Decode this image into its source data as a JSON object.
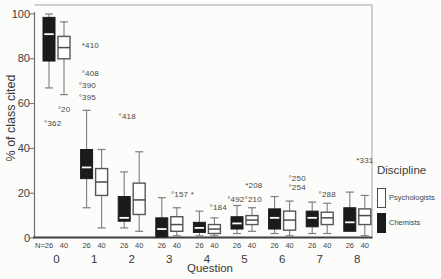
{
  "figure": {
    "background": "#fcfcfa",
    "frame_color": "#a3a3a3",
    "axis_color": "#3d3d3d",
    "whisker_color": "#7e7e7e",
    "text_color": "#3b3b3b"
  },
  "chart_data": {
    "type": "boxplot",
    "title": "",
    "xlabel": "Question",
    "ylabel": "% of class cited",
    "ylim": [
      0,
      100
    ],
    "yticks": [
      0,
      20,
      40,
      60,
      80,
      100
    ],
    "categories": [
      "0",
      "1",
      "2",
      "3",
      "4",
      "5",
      "6",
      "7",
      "8"
    ],
    "n_row_prefix": "N=",
    "grid": false,
    "series": [
      {
        "name": "Chemists",
        "n_label": "26",
        "fill": "#1b1b1b",
        "style": "filled",
        "x_offset": -7.5,
        "boxes": [
          {
            "lo": 67,
            "q1": 79,
            "med": 91,
            "q3": 98.5,
            "hi": 100
          },
          {
            "lo": 13.5,
            "q1": 26.5,
            "med": 31.5,
            "q3": 39.5,
            "hi": 57
          },
          {
            "lo": 4.5,
            "q1": 7.5,
            "med": 9,
            "q3": 18.5,
            "hi": 29.5
          },
          {
            "lo": 0.5,
            "q1": 0.5,
            "med": 4,
            "q3": 9,
            "hi": 18
          },
          {
            "lo": 1,
            "q1": 2.5,
            "med": 4.5,
            "q3": 7,
            "hi": 12
          },
          {
            "lo": 2,
            "q1": 4,
            "med": 6.5,
            "q3": 9.5,
            "hi": 14.5
          },
          {
            "lo": 2,
            "q1": 4,
            "med": 9,
            "q3": 13,
            "hi": 18.5
          },
          {
            "lo": 2,
            "q1": 5,
            "med": 9,
            "q3": 12,
            "hi": 16
          },
          {
            "lo": 3,
            "q1": 3,
            "med": 7,
            "q3": 13.5,
            "hi": 20.5
          }
        ]
      },
      {
        "name": "Psychologists",
        "n_label": "40",
        "fill": "#ffffff",
        "style": "open",
        "x_offset": 7.5,
        "boxes": [
          {
            "lo": 64,
            "q1": 80,
            "med": 85,
            "q3": 90,
            "hi": 96.5
          },
          {
            "lo": 4.5,
            "q1": 19,
            "med": 25,
            "q3": 31,
            "hi": 39.5
          },
          {
            "lo": 3,
            "q1": 10.5,
            "med": 17,
            "q3": 24.5,
            "hi": 38.5
          },
          {
            "lo": 1,
            "q1": 3,
            "med": 6,
            "q3": 9.5,
            "hi": 13.5
          },
          {
            "lo": 1,
            "q1": 2,
            "med": 4,
            "q3": 6,
            "hi": 9
          },
          {
            "lo": 3,
            "q1": 6,
            "med": 8,
            "q3": 10,
            "hi": 13.5
          },
          {
            "lo": 1,
            "q1": 3.5,
            "med": 8,
            "q3": 12,
            "hi": 16.5
          },
          {
            "lo": 2,
            "q1": 6,
            "med": 9,
            "q3": 11.5,
            "hi": 15.5
          },
          {
            "lo": 1,
            "q1": 6,
            "med": 10,
            "q3": 13,
            "hi": 19
          }
        ]
      }
    ],
    "annotations": [
      {
        "text": "°20",
        "x_units": 0.2,
        "y_value": 57
      },
      {
        "text": "°362",
        "x_units": -0.1,
        "y_value": 50.5
      },
      {
        "text": "*410",
        "x_units": 0.9,
        "y_value": 85.5
      },
      {
        "text": "°408",
        "x_units": 0.9,
        "y_value": 73
      },
      {
        "text": "°390",
        "x_units": 0.82,
        "y_value": 67.5
      },
      {
        "text": "°395",
        "x_units": 0.82,
        "y_value": 62.5
      },
      {
        "text": "°418",
        "x_units": 1.88,
        "y_value": 54
      },
      {
        "text": "°157 *",
        "x_units": 3.35,
        "y_value": 19
      },
      {
        "text": "°184",
        "x_units": 4.3,
        "y_value": 13
      },
      {
        "text": "*208",
        "x_units": 5.25,
        "y_value": 23
      },
      {
        "text": "°492°210",
        "x_units": 5.0,
        "y_value": 16.8
      },
      {
        "text": "°250",
        "x_units": 6.4,
        "y_value": 26
      },
      {
        "text": "°254",
        "x_units": 6.4,
        "y_value": 22.3
      },
      {
        "text": "°288",
        "x_units": 7.2,
        "y_value": 19
      },
      {
        "text": "*331",
        "x_units": 8.2,
        "y_value": 34
      }
    ],
    "legend": {
      "title": "Discipline",
      "position": "right",
      "entries": [
        {
          "label": "Psychologists",
          "style": "open",
          "fill": "#ffffff"
        },
        {
          "label": "Chemists",
          "style": "filled",
          "fill": "#1b1b1b"
        }
      ]
    }
  }
}
